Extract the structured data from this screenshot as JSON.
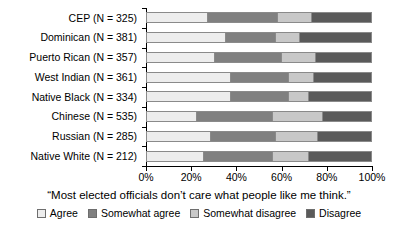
{
  "chart_data": {
    "type": "bar",
    "orientation": "horizontal",
    "stacked": true,
    "stacked_normalized": true,
    "title": "",
    "subtitle": "",
    "caption": "“Most elected officials don’t care what people like me think.”",
    "xlabel": "",
    "ylabel": "",
    "xlim": [
      0,
      100
    ],
    "xticks": [
      0,
      20,
      40,
      60,
      80,
      100
    ],
    "xtick_labels": [
      "0%",
      "20%",
      "40%",
      "60%",
      "80%",
      "100%"
    ],
    "grid": false,
    "legend_position": "bottom",
    "categories": [
      "CEP (N = 325)",
      "Dominican (N = 381)",
      "Puerto Rican (N = 357)",
      "West Indian (N = 361)",
      "Native Black (N = 334)",
      "Chinese (N = 535)",
      "Russian (N = 285)",
      "Native White (N = 212)"
    ],
    "series": [
      {
        "name": "Agree",
        "color": "#ededed",
        "values": [
          27,
          35,
          30,
          37,
          37,
          22,
          28,
          25
        ]
      },
      {
        "name": "Somewhat agree",
        "color": "#808080",
        "values": [
          31,
          22,
          30,
          26,
          26,
          34,
          29,
          31
        ]
      },
      {
        "name": "Somewhat disagree",
        "color": "#c8c8c8",
        "values": [
          15,
          11,
          15,
          11,
          9,
          22,
          19,
          16
        ]
      },
      {
        "name": "Disagree",
        "color": "#5a5a5a",
        "values": [
          27,
          32,
          25,
          26,
          28,
          22,
          24,
          28
        ]
      }
    ]
  },
  "legend": {
    "items": [
      {
        "label": "Agree",
        "color": "#ededed"
      },
      {
        "label": "Somewhat agree",
        "color": "#808080"
      },
      {
        "label": "Somewhat disagree",
        "color": "#c8c8c8"
      },
      {
        "label": "Disagree",
        "color": "#5a5a5a"
      }
    ]
  }
}
